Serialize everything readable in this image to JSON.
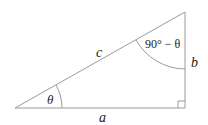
{
  "diagram": {
    "type": "right-triangle",
    "colors": {
      "stroke": "#9a9a9a",
      "text": "#222222"
    },
    "labels": {
      "hypotenuse": "c",
      "adjacent": "a",
      "opposite": "b",
      "angle_bottom_left": "θ",
      "angle_top_right": "90° − θ"
    },
    "right_angle_marker": true
  }
}
